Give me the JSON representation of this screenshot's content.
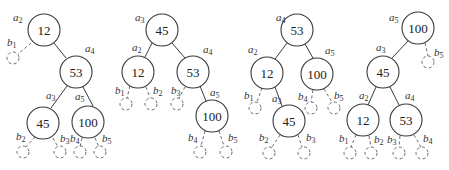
{
  "diagram": {
    "type": "binary-search-tree-rotations",
    "trees": [
      {
        "nodes": [
          {
            "id": "a2",
            "label": "a",
            "sub": "2",
            "value": "12",
            "x": 44,
            "y": 30
          },
          {
            "id": "a4",
            "label": "a",
            "sub": "4",
            "value": "53",
            "x": 76,
            "y": 72
          },
          {
            "id": "a3",
            "label": "a",
            "sub": "3",
            "value": "45",
            "x": 43,
            "y": 123
          },
          {
            "id": "a5",
            "label": "a",
            "sub": "5",
            "value": "100",
            "x": 88,
            "y": 122
          }
        ],
        "leaves": [
          {
            "id": "b1",
            "label": "b",
            "sub": "1",
            "x": 13,
            "y": 58
          },
          {
            "id": "b2",
            "label": "b",
            "sub": "2",
            "x": 23,
            "y": 152
          },
          {
            "id": "b3",
            "label": "b",
            "sub": "3",
            "x": 60,
            "y": 152
          },
          {
            "id": "b4",
            "label": "b",
            "sub": "4",
            "x": 80,
            "y": 152
          },
          {
            "id": "b5",
            "label": "b",
            "sub": "5",
            "x": 100,
            "y": 152
          }
        ]
      },
      {
        "nodes": [
          {
            "id": "a3",
            "label": "a",
            "sub": "3",
            "value": "45",
            "x": 162,
            "y": 30
          },
          {
            "id": "a2",
            "label": "a",
            "sub": "2",
            "value": "12",
            "x": 138,
            "y": 72
          },
          {
            "id": "a4",
            "label": "a",
            "sub": "4",
            "value": "53",
            "x": 193,
            "y": 72
          },
          {
            "id": "a5",
            "label": "a",
            "sub": "5",
            "value": "100",
            "x": 212,
            "y": 116
          }
        ],
        "leaves": [
          {
            "id": "b1",
            "label": "b",
            "sub": "1",
            "x": 126,
            "y": 104
          },
          {
            "id": "b2",
            "label": "b",
            "sub": "2",
            "x": 151,
            "y": 104
          },
          {
            "id": "b3",
            "label": "b",
            "sub": "3",
            "x": 177,
            "y": 104
          },
          {
            "id": "b4",
            "label": "b",
            "sub": "4",
            "x": 200,
            "y": 152
          },
          {
            "id": "b5",
            "label": "b",
            "sub": "5",
            "x": 226,
            "y": 152
          }
        ]
      },
      {
        "nodes": [
          {
            "id": "a4",
            "label": "a",
            "sub": "4",
            "value": "53",
            "x": 297,
            "y": 30
          },
          {
            "id": "a2",
            "label": "a",
            "sub": "2",
            "value": "12",
            "x": 267,
            "y": 73
          },
          {
            "id": "a5",
            "label": "a",
            "sub": "5",
            "value": "100",
            "x": 317,
            "y": 74
          },
          {
            "id": "a3",
            "label": "a",
            "sub": "3",
            "value": "45",
            "x": 289,
            "y": 121
          }
        ],
        "leaves": [
          {
            "id": "b1",
            "label": "b",
            "sub": "1",
            "x": 255,
            "y": 108
          },
          {
            "id": "b2",
            "label": "b",
            "sub": "2",
            "x": 269,
            "y": 153
          },
          {
            "id": "b3",
            "label": "b",
            "sub": "3",
            "x": 304,
            "y": 153
          },
          {
            "id": "b4",
            "label": "b",
            "sub": "4",
            "x": 311,
            "y": 108
          },
          {
            "id": "b5",
            "label": "b",
            "sub": "5",
            "x": 334,
            "y": 108
          }
        ]
      },
      {
        "nodes": [
          {
            "id": "a5",
            "label": "a",
            "sub": "5",
            "value": "100",
            "x": 418,
            "y": 28
          },
          {
            "id": "a3",
            "label": "a",
            "sub": "3",
            "value": "45",
            "x": 383,
            "y": 72
          },
          {
            "id": "a2",
            "label": "a",
            "sub": "2",
            "value": "12",
            "x": 363,
            "y": 120
          },
          {
            "id": "a4",
            "label": "a",
            "sub": "4",
            "value": "53",
            "x": 406,
            "y": 120
          }
        ],
        "leaves": [
          {
            "id": "b5",
            "label": "b",
            "sub": "5",
            "x": 428,
            "y": 62
          },
          {
            "id": "b1",
            "label": "b",
            "sub": "1",
            "x": 350,
            "y": 153
          },
          {
            "id": "b2",
            "label": "b",
            "sub": "2",
            "x": 371,
            "y": 153
          },
          {
            "id": "b3",
            "label": "b",
            "sub": "3",
            "x": 399,
            "y": 153
          },
          {
            "id": "b4",
            "label": "b",
            "sub": "4",
            "x": 422,
            "y": 153
          }
        ]
      }
    ]
  }
}
